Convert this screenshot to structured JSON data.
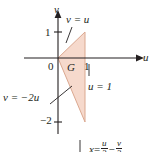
{
  "figure": {
    "type": "math-coordinate-diagram",
    "plane": "uv-plane",
    "background_color": "#ffffff",
    "ink_color": "#231f20",
    "region_fill_color": "#f6d9cc",
    "region_stroke_color": "#d9a28c"
  },
  "axes": {
    "horizontal": {
      "name": "u",
      "label": "u",
      "arrow": true,
      "ticks": [
        {
          "label": "0",
          "value": 0
        },
        {
          "label": "1",
          "value": 1
        }
      ]
    },
    "vertical": {
      "name": "v",
      "label": "v",
      "arrow": true,
      "ticks": [
        {
          "label": "1",
          "value": 1
        },
        {
          "label": "−2",
          "value": -2
        }
      ]
    }
  },
  "region": {
    "label": "G",
    "vertices": [
      {
        "u": 0,
        "v": 0
      },
      {
        "u": 1,
        "v": 1
      },
      {
        "u": 1,
        "v": -2
      }
    ]
  },
  "boundary_labels": {
    "upper_line": "v = u",
    "right_line": "u = 1",
    "lower_line": "v = −2u"
  },
  "bottom_formula": {
    "lhs": "x",
    "equals": "=",
    "term1": {
      "numerator": "u",
      "denominator": "3"
    },
    "operator": "−",
    "term2": {
      "numerator": "v",
      "denominator": "3"
    },
    "clipped": true
  }
}
